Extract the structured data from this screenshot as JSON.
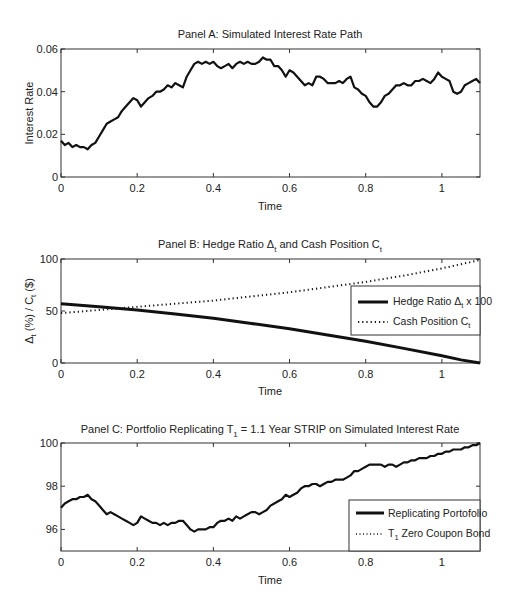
{
  "chart_data": [
    {
      "type": "line",
      "title": "Panel A: Simulated Interest Rate Path",
      "xlabel": "Time",
      "ylabel": "Interest Rate",
      "xlim": [
        0,
        1.1
      ],
      "ylim": [
        0,
        0.06
      ],
      "xticks": [
        "0",
        "0.2",
        "0.4",
        "0.6",
        "0.8",
        "1"
      ],
      "yticks": [
        "0",
        "0.02",
        "0.04",
        "0.06"
      ],
      "grid": false,
      "series": [
        {
          "name": "Interest Rate",
          "style": "solid",
          "x": [
            0,
            0.01,
            0.02,
            0.03,
            0.04,
            0.05,
            0.06,
            0.07,
            0.08,
            0.09,
            0.1,
            0.11,
            0.12,
            0.13,
            0.14,
            0.15,
            0.16,
            0.17,
            0.18,
            0.19,
            0.2,
            0.21,
            0.22,
            0.23,
            0.24,
            0.25,
            0.26,
            0.27,
            0.28,
            0.29,
            0.3,
            0.31,
            0.32,
            0.33,
            0.34,
            0.35,
            0.36,
            0.37,
            0.38,
            0.39,
            0.4,
            0.41,
            0.42,
            0.43,
            0.44,
            0.45,
            0.46,
            0.47,
            0.48,
            0.49,
            0.5,
            0.51,
            0.52,
            0.53,
            0.54,
            0.55,
            0.56,
            0.57,
            0.58,
            0.59,
            0.6,
            0.61,
            0.62,
            0.63,
            0.64,
            0.65,
            0.66,
            0.67,
            0.68,
            0.69,
            0.7,
            0.71,
            0.72,
            0.73,
            0.74,
            0.75,
            0.76,
            0.77,
            0.78,
            0.79,
            0.8,
            0.81,
            0.82,
            0.83,
            0.84,
            0.85,
            0.86,
            0.87,
            0.88,
            0.89,
            0.9,
            0.91,
            0.92,
            0.93,
            0.94,
            0.95,
            0.96,
            0.97,
            0.98,
            0.99,
            1.0,
            1.01,
            1.02,
            1.03,
            1.04,
            1.05,
            1.06,
            1.07,
            1.08,
            1.09,
            1.1
          ],
          "values": [
            0.017,
            0.015,
            0.016,
            0.014,
            0.015,
            0.014,
            0.014,
            0.013,
            0.015,
            0.016,
            0.019,
            0.022,
            0.025,
            0.026,
            0.027,
            0.028,
            0.031,
            0.033,
            0.035,
            0.037,
            0.036,
            0.033,
            0.035,
            0.037,
            0.038,
            0.04,
            0.04,
            0.041,
            0.043,
            0.042,
            0.044,
            0.043,
            0.042,
            0.047,
            0.05,
            0.053,
            0.054,
            0.053,
            0.054,
            0.053,
            0.054,
            0.052,
            0.051,
            0.052,
            0.053,
            0.051,
            0.053,
            0.054,
            0.053,
            0.054,
            0.053,
            0.053,
            0.054,
            0.056,
            0.055,
            0.055,
            0.052,
            0.052,
            0.05,
            0.047,
            0.05,
            0.049,
            0.047,
            0.045,
            0.043,
            0.044,
            0.043,
            0.047,
            0.047,
            0.046,
            0.044,
            0.044,
            0.044,
            0.045,
            0.044,
            0.046,
            0.047,
            0.042,
            0.041,
            0.039,
            0.038,
            0.035,
            0.033,
            0.033,
            0.035,
            0.038,
            0.039,
            0.041,
            0.043,
            0.043,
            0.044,
            0.043,
            0.043,
            0.045,
            0.045,
            0.046,
            0.045,
            0.044,
            0.046,
            0.049,
            0.047,
            0.046,
            0.045,
            0.04,
            0.039,
            0.04,
            0.043,
            0.044,
            0.045,
            0.046,
            0.044
          ]
        }
      ]
    },
    {
      "type": "line",
      "title_main": "Panel B: Hedge Ratio ",
      "title_sym1": "Δ",
      "title_sub1": "t",
      "title_mid": " and Cash Position C",
      "title_sub2": "t",
      "xlabel": "Time",
      "ylabel_parts": [
        "Δ",
        "t",
        " (%) / C",
        "t",
        " ($)"
      ],
      "xlim": [
        0,
        1.1
      ],
      "ylim": [
        0,
        100
      ],
      "xticks": [
        "0",
        "0.2",
        "0.4",
        "0.6",
        "0.8",
        "1"
      ],
      "yticks": [
        "0",
        "50",
        "100"
      ],
      "grid": false,
      "legend_position": "right",
      "series": [
        {
          "name": "Hedge Ratio Δt x 100",
          "legend_main": "Hedge Ratio Δ",
          "legend_sub": "t",
          "legend_tail": " x 100",
          "style": "solid",
          "x": [
            0,
            0.1,
            0.2,
            0.3,
            0.4,
            0.5,
            0.6,
            0.7,
            0.8,
            0.9,
            1.0,
            1.05,
            1.1
          ],
          "values": [
            57,
            54,
            51,
            47,
            43,
            38,
            33,
            27,
            21,
            14,
            7,
            3,
            0
          ]
        },
        {
          "name": "Cash Position Ct",
          "legend_main": "Cash Position C",
          "legend_sub": "t",
          "style": "dotted",
          "x": [
            0,
            0.1,
            0.2,
            0.3,
            0.4,
            0.5,
            0.6,
            0.7,
            0.8,
            0.9,
            1.0,
            1.1
          ],
          "values": [
            48,
            51,
            54,
            57,
            60,
            64,
            68,
            73,
            78,
            84,
            91,
            99
          ]
        }
      ]
    },
    {
      "type": "line",
      "title_main": "Panel C: Portfolio Replicating T",
      "title_sub": "1",
      "title_tail": " = 1.1 Year STRIP on Simulated Interest Rate",
      "xlabel": "Time",
      "ylabel": "",
      "xlim": [
        0,
        1.1
      ],
      "ylim": [
        95,
        100
      ],
      "xticks": [
        "0",
        "0.2",
        "0.4",
        "0.6",
        "0.8",
        "1"
      ],
      "yticks": [
        "96",
        "98",
        "100"
      ],
      "grid": false,
      "legend_position": "lower right",
      "series": [
        {
          "name": "Replicating Portofolio",
          "legend_main": "Replicating Portofolio",
          "style": "solid",
          "x": [
            0,
            0.01,
            0.02,
            0.03,
            0.04,
            0.05,
            0.06,
            0.07,
            0.08,
            0.09,
            0.1,
            0.11,
            0.12,
            0.13,
            0.14,
            0.15,
            0.16,
            0.17,
            0.18,
            0.19,
            0.2,
            0.21,
            0.22,
            0.23,
            0.24,
            0.25,
            0.26,
            0.27,
            0.28,
            0.29,
            0.3,
            0.31,
            0.32,
            0.33,
            0.34,
            0.35,
            0.36,
            0.37,
            0.38,
            0.39,
            0.4,
            0.41,
            0.42,
            0.43,
            0.44,
            0.45,
            0.46,
            0.47,
            0.48,
            0.49,
            0.5,
            0.51,
            0.52,
            0.53,
            0.54,
            0.55,
            0.56,
            0.57,
            0.58,
            0.59,
            0.6,
            0.61,
            0.62,
            0.63,
            0.64,
            0.65,
            0.66,
            0.67,
            0.68,
            0.69,
            0.7,
            0.71,
            0.72,
            0.73,
            0.74,
            0.75,
            0.76,
            0.77,
            0.78,
            0.79,
            0.8,
            0.81,
            0.82,
            0.83,
            0.84,
            0.85,
            0.86,
            0.87,
            0.88,
            0.89,
            0.9,
            0.91,
            0.92,
            0.93,
            0.94,
            0.95,
            0.96,
            0.97,
            0.98,
            0.99,
            1.0,
            1.01,
            1.02,
            1.03,
            1.04,
            1.05,
            1.06,
            1.07,
            1.08,
            1.09,
            1.1
          ],
          "values": [
            97.0,
            97.2,
            97.3,
            97.4,
            97.4,
            97.5,
            97.5,
            97.6,
            97.4,
            97.3,
            97.1,
            96.9,
            96.7,
            96.8,
            96.7,
            96.6,
            96.5,
            96.4,
            96.3,
            96.2,
            96.3,
            96.6,
            96.5,
            96.4,
            96.3,
            96.3,
            96.2,
            96.3,
            96.2,
            96.3,
            96.3,
            96.4,
            96.4,
            96.2,
            96.0,
            95.9,
            96.0,
            96.0,
            96.0,
            96.1,
            96.1,
            96.3,
            96.4,
            96.4,
            96.5,
            96.4,
            96.6,
            96.5,
            96.6,
            96.7,
            96.8,
            96.8,
            96.7,
            96.8,
            96.9,
            97.1,
            97.2,
            97.3,
            97.4,
            97.6,
            97.5,
            97.6,
            97.7,
            97.9,
            98.0,
            98.0,
            98.1,
            98.1,
            98.0,
            98.1,
            98.2,
            98.2,
            98.3,
            98.3,
            98.3,
            98.4,
            98.5,
            98.7,
            98.7,
            98.8,
            98.9,
            99.0,
            99.0,
            99.0,
            99.0,
            98.9,
            99.0,
            99.0,
            98.9,
            99.0,
            99.1,
            99.1,
            99.2,
            99.2,
            99.3,
            99.3,
            99.3,
            99.4,
            99.4,
            99.5,
            99.5,
            99.6,
            99.6,
            99.7,
            99.7,
            99.7,
            99.8,
            99.8,
            99.9,
            99.9,
            100.0
          ]
        },
        {
          "name": "T1 Zero Coupon Bond",
          "legend_main": "T",
          "legend_sub": "1",
          "legend_tail": " Zero Coupon Bond",
          "style": "dotted",
          "x": [],
          "values": []
        }
      ]
    }
  ]
}
